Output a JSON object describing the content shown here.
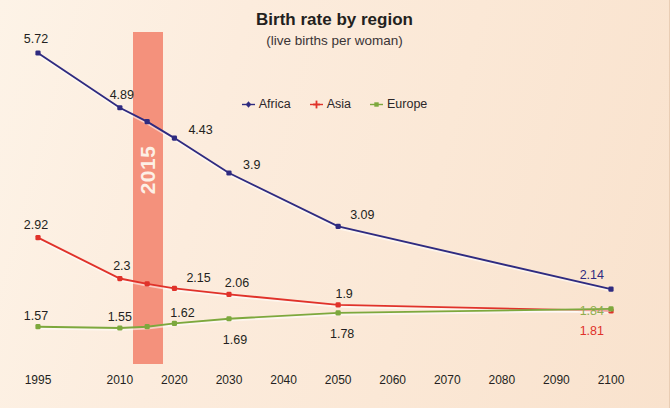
{
  "header": {
    "title": "Birth rate by region",
    "subtitle": "(live births per woman)"
  },
  "legend": {
    "items": [
      {
        "label": "Africa",
        "color": "#2f2b80",
        "marker": "diamond-marker-icon"
      },
      {
        "label": "Asia",
        "color": "#e0322a",
        "marker": "cross-marker-icon"
      },
      {
        "label": "Europe",
        "color": "#7da83d",
        "marker": "square-marker-icon"
      }
    ]
  },
  "highlight": {
    "label": "2015",
    "color": "#f4917c",
    "text_color": "#fdf0e6"
  },
  "chart_data": {
    "type": "line",
    "title": "Birth rate by region",
    "subtitle": "(live births per woman)",
    "xlabel": "",
    "ylabel": "live births per woman",
    "x": [
      1995,
      2010,
      2015,
      2020,
      2030,
      2050,
      2100
    ],
    "xlim": [
      1995,
      2100
    ],
    "ylim": [
      1.4,
      5.9
    ],
    "grid": false,
    "legend_position": "top-center",
    "xticks": [
      "1995",
      "2010",
      "2020",
      "2030",
      "2040",
      "2050",
      "2060",
      "2070",
      "2080",
      "2090",
      "2100"
    ],
    "highlight_band": {
      "x": 2015,
      "label": "2015"
    },
    "series": [
      {
        "name": "Africa",
        "color": "#2f2b80",
        "values": [
          5.72,
          4.89,
          4.68,
          4.43,
          3.9,
          3.09,
          2.14
        ],
        "labels": [
          "5.72",
          "4.89",
          "",
          "4.43",
          "3.9",
          "3.09",
          "2.14"
        ]
      },
      {
        "name": "Asia",
        "color": "#e0322a",
        "values": [
          2.92,
          2.3,
          2.22,
          2.15,
          2.06,
          1.9,
          1.81
        ],
        "labels": [
          "2.92",
          "2.3",
          "",
          "2.15",
          "2.06",
          "1.9",
          "1.81"
        ]
      },
      {
        "name": "Europe",
        "color": "#7da83d",
        "values": [
          1.57,
          1.55,
          1.57,
          1.62,
          1.69,
          1.78,
          1.84
        ],
        "labels": [
          "1.57",
          "1.55",
          "",
          "1.62",
          "1.69",
          "1.78",
          "1.84"
        ]
      }
    ]
  }
}
